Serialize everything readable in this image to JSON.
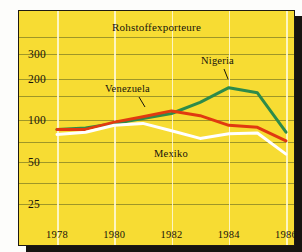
{
  "chart_data": {
    "type": "line",
    "title": "Rohstoffexporteure",
    "xlabel": "",
    "ylabel": "",
    "yscale": "log",
    "ylim": [
      20,
      400
    ],
    "yticks": [
      300,
      200,
      100,
      50,
      25
    ],
    "ytick_labels": [
      "300",
      "200",
      "100",
      "50",
      "25"
    ],
    "x": [
      1978,
      1979,
      1980,
      1981,
      1982,
      1983,
      1984,
      1985,
      1986
    ],
    "xticks": [
      1978,
      1980,
      1982,
      1984,
      1986
    ],
    "xtick_labels": [
      "1978",
      "1980",
      "1982",
      "1984",
      "1986"
    ],
    "grid": true,
    "legend": "inline-annotations",
    "series": [
      {
        "name": "Nigeria",
        "color": "#2e8b4a",
        "values": [
          86,
          88,
          95,
          103,
          112,
          135,
          172,
          158,
          82
        ]
      },
      {
        "name": "Venezuela",
        "color": "#e03a10",
        "values": [
          86,
          86,
          97,
          106,
          117,
          108,
          92,
          89,
          71
        ]
      },
      {
        "name": "Mexiko",
        "color": "#ffffff",
        "values": [
          79,
          82,
          92,
          95,
          84,
          74,
          80,
          81,
          57
        ]
      }
    ],
    "annotations": [
      {
        "text": "Nigeria",
        "series": "Nigeria"
      },
      {
        "text": "Venezuela",
        "series": "Venezuela"
      },
      {
        "text": "Mexiko",
        "series": "Mexiko"
      }
    ],
    "colors": {
      "background": "#f7dc33",
      "frame": "#1d1a14",
      "hgrid": "#8f8a27",
      "vgrid": "#fdf7d2",
      "text": "#15120c"
    }
  }
}
